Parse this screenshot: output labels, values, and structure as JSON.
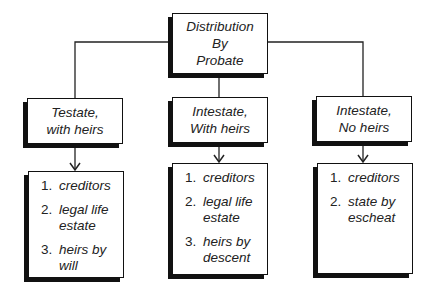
{
  "root": {
    "lines": [
      "Distribution",
      "By",
      "Probate"
    ]
  },
  "branches": [
    {
      "header": [
        "Testate,",
        "with heirs"
      ],
      "items": [
        {
          "num": "1.",
          "text": "creditors"
        },
        {
          "num": "2.",
          "text": "legal life estate"
        },
        {
          "num": "3.",
          "text": "heirs by will"
        }
      ]
    },
    {
      "header": [
        "Intestate,",
        "With heirs"
      ],
      "items": [
        {
          "num": "1.",
          "text": "creditors"
        },
        {
          "num": "2.",
          "text": "legal life estate"
        },
        {
          "num": "3.",
          "text": "heirs by descent"
        }
      ]
    },
    {
      "header": [
        "Intestate,",
        "No heirs"
      ],
      "items": [
        {
          "num": "1.",
          "text": "creditors"
        },
        {
          "num": "2.",
          "text": "state by escheat"
        }
      ]
    }
  ],
  "colors": {
    "stroke": "#111111",
    "background": "#ffffff",
    "text": "#222222"
  }
}
